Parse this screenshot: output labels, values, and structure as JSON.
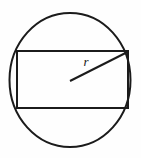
{
  "figure": {
    "name": "circle-with-inscribed-rectangle",
    "background_color": "#fefefe",
    "stroke_color": "#1b1b1b",
    "label_color": "#161616",
    "canvas": {
      "width": 141,
      "height": 158
    },
    "circle": {
      "name": "outer-circle",
      "center_x": 70,
      "center_y": 80,
      "radius_x": 60.5,
      "radius_y": 67,
      "stroke_width": 2
    },
    "rectangle": {
      "name": "inscribed-rectangle",
      "x": 17,
      "y": 51,
      "width": 111,
      "height": 57,
      "stroke_width": 2
    },
    "radius_segment": {
      "name": "radius-line",
      "x1": 70,
      "y1": 81,
      "x2": 128.5,
      "y2": 51.5,
      "stroke_width": 2
    },
    "radius_label": {
      "text": "r",
      "x": 86,
      "y": 66,
      "font_size": 13
    }
  }
}
